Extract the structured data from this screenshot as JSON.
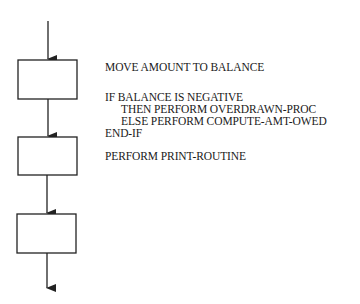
{
  "diagram": {
    "type": "flowchart",
    "stroke_color": "#222222",
    "text_color": "#1a1a1a",
    "boxes": [
      {
        "id": "step-1",
        "x": 18,
        "y": 60,
        "w": 59,
        "h": 39
      },
      {
        "id": "step-2",
        "x": 18,
        "y": 137,
        "w": 59,
        "h": 38
      },
      {
        "id": "step-3",
        "x": 17,
        "y": 214,
        "w": 59,
        "h": 39
      }
    ],
    "arrows": [
      {
        "id": "entry-arrow",
        "x": 48,
        "y1": 21,
        "y2": 60
      },
      {
        "id": "arrow-1-2",
        "x": 48,
        "y1": 99,
        "y2": 137
      },
      {
        "id": "arrow-2-3",
        "x": 47,
        "y1": 175,
        "y2": 214
      },
      {
        "id": "exit-arrow",
        "x": 47,
        "y1": 253,
        "y2": 289
      }
    ]
  },
  "code": {
    "lines": [
      {
        "text": "MOVE AMOUNT TO BALANCE",
        "indent": 0,
        "y": 61
      },
      {
        "text": "IF BALANCE IS NEGATIVE",
        "indent": 0,
        "y": 91
      },
      {
        "text": "THEN PERFORM OVERDRAWN-PROC",
        "indent": 1,
        "y": 103
      },
      {
        "text": "ELSE PERFORM COMPUTE-AMT-OWED",
        "indent": 1,
        "y": 115
      },
      {
        "text": "END-IF",
        "indent": 0,
        "y": 127
      },
      {
        "text": "PERFORM PRINT-ROUTINE",
        "indent": 0,
        "y": 150
      }
    ]
  }
}
